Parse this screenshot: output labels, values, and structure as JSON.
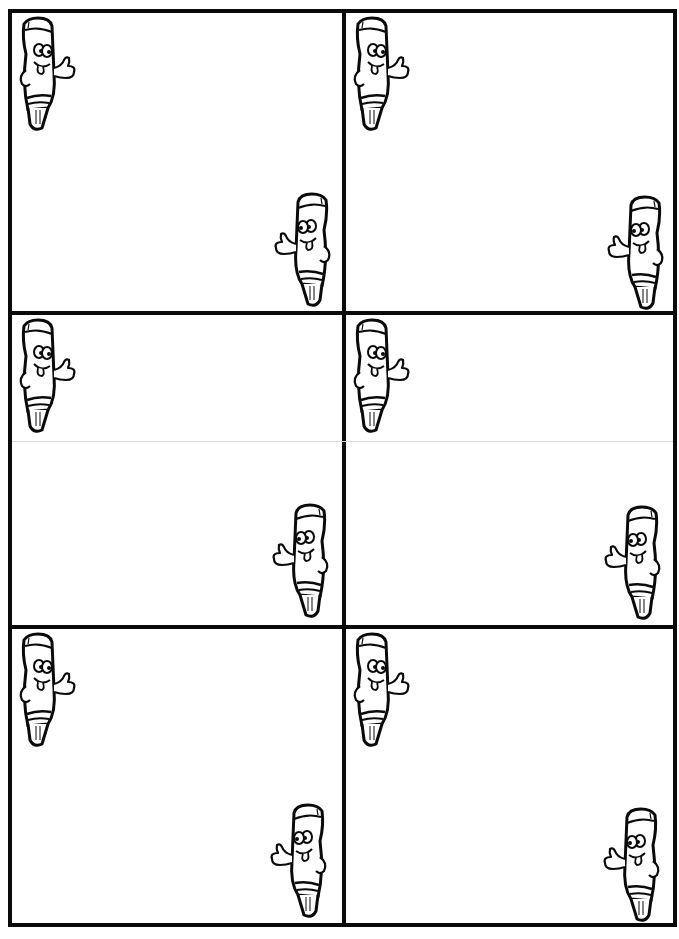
{
  "page": {
    "grid": {
      "rows": 3,
      "cols": 2
    },
    "colors": {
      "border": "#0a0a0a",
      "fold_line": "#d6d6d6",
      "background": "#ffffff"
    }
  },
  "cards": [
    {
      "id": 1,
      "row": 0,
      "col": 0,
      "text": "",
      "icons": [
        "crayon-mascot-top-left",
        "crayon-mascot-bottom-right"
      ]
    },
    {
      "id": 2,
      "row": 0,
      "col": 1,
      "text": "",
      "icons": [
        "crayon-mascot-top-left",
        "crayon-mascot-bottom-right"
      ]
    },
    {
      "id": 3,
      "row": 1,
      "col": 0,
      "text": "",
      "icons": [
        "crayon-mascot-top-left",
        "crayon-mascot-bottom-right"
      ]
    },
    {
      "id": 4,
      "row": 1,
      "col": 1,
      "text": "",
      "icons": [
        "crayon-mascot-top-left",
        "crayon-mascot-bottom-right"
      ]
    },
    {
      "id": 5,
      "row": 2,
      "col": 0,
      "text": "",
      "icons": [
        "crayon-mascot-top-left",
        "crayon-mascot-bottom-right"
      ]
    },
    {
      "id": 6,
      "row": 2,
      "col": 1,
      "text": "",
      "icons": [
        "crayon-mascot-top-left",
        "crayon-mascot-bottom-right"
      ]
    }
  ]
}
